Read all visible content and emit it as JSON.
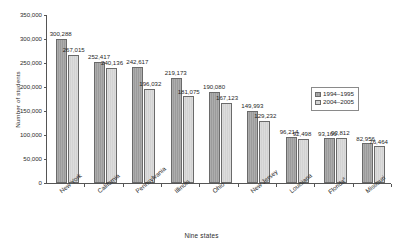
{
  "chart_data": {
    "type": "bar",
    "title": "",
    "xlabel": "Nine states",
    "ylabel": "Number of students",
    "categories": [
      "New York",
      "California",
      "Pennsylvania",
      "Illinois",
      "Ohio",
      "New Jersey",
      "Louisiana",
      "Florida",
      "Missouri"
    ],
    "category_footnotes": [
      "",
      "",
      "",
      "",
      "",
      "",
      "",
      "a",
      ""
    ],
    "series": [
      {
        "name": "1994–1995",
        "color": "#9b9b9b",
        "values": [
          300288,
          252417,
          242617,
          219173,
          190080,
          149993,
          96214,
          93166,
          82956
        ],
        "labels": [
          "300,288",
          "252,417",
          "242,617",
          "219,173",
          "190,080",
          "149,993",
          "96,214",
          "93,166",
          "82,956"
        ]
      },
      {
        "name": "2004–2005",
        "color": "#d2d2d2",
        "values": [
          267015,
          240136,
          196032,
          181075,
          167123,
          129232,
          92498,
          93812,
          76464
        ],
        "labels": [
          "267,015",
          "240,136",
          "196,032",
          "181,075",
          "167,123",
          "129,232",
          "92,498",
          "93,812",
          "76,464"
        ]
      }
    ],
    "ylim": [
      0,
      350000
    ],
    "ytick_values": [
      0,
      50000,
      100000,
      150000,
      200000,
      250000,
      300000,
      350000
    ],
    "ytick_labels": [
      "0",
      "50,000",
      "100,000",
      "150,000",
      "200,000",
      "250,000",
      "300,000",
      "350,000"
    ],
    "grid": false,
    "legend_position": "right-middle"
  }
}
